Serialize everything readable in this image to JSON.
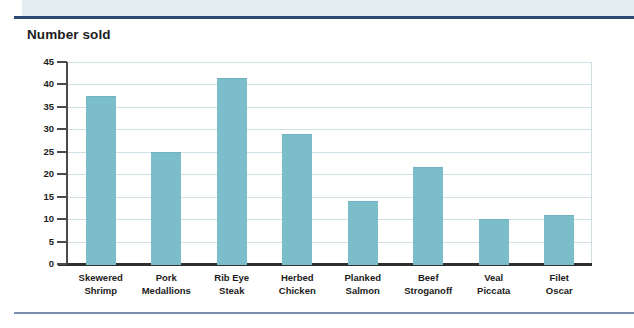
{
  "page": {
    "title_text": "Number sold",
    "accent_rule_color": "#2b4a72",
    "footer_rule_color": "#7a8eae",
    "band_color": "#e4eef0",
    "bar_color": "#7cbdca",
    "gridline_color": "#cfe0e6"
  },
  "chart_data": {
    "type": "bar",
    "title": "Number sold",
    "xlabel": "",
    "ylabel": "Number sold",
    "ylim": [
      0,
      45
    ],
    "ytick_step": 5,
    "yticks": [
      45,
      40,
      35,
      30,
      25,
      20,
      15,
      10,
      5,
      0
    ],
    "grid": true,
    "legend": false,
    "categories": [
      "Skewered Shrimp",
      "Pork Medallions",
      "Rib Eye Steak",
      "Herbed Chicken",
      "Planked Salmon",
      "Beef Stroganoff",
      "Veal Piccata",
      "Filet Oscar"
    ],
    "category_lines": [
      [
        "Skewered",
        "Shrimp"
      ],
      [
        "Pork",
        "Medallions"
      ],
      [
        "Rib Eye",
        "Steak"
      ],
      [
        "Herbed",
        "Chicken"
      ],
      [
        "Planked",
        "Salmon"
      ],
      [
        "Beef",
        "Stroganoff"
      ],
      [
        "Veal",
        "Piccata"
      ],
      [
        "Filet",
        "Oscar"
      ]
    ],
    "values": [
      37.5,
      25,
      41.5,
      29,
      14,
      21.5,
      10,
      11
    ],
    "series": [
      {
        "name": "Number sold",
        "values": [
          37.5,
          25,
          41.5,
          29,
          14,
          21.5,
          10,
          11
        ]
      }
    ]
  }
}
